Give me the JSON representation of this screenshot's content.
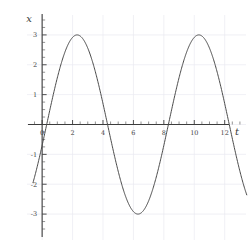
{
  "figure": {
    "background_color": "#ffffff",
    "curve_color": "#4a4a4a",
    "axis_color": "#3c3c3c",
    "grid_color": "#e9e9f0"
  },
  "axes": {
    "x_axis_label": "t",
    "y_axis_label": "x"
  },
  "chart_data": {
    "type": "line",
    "title": "",
    "subtitle": "",
    "xlabel": "t",
    "ylabel": "x",
    "xlim": [
      -0.6,
      13.4
    ],
    "ylim": [
      -3.6,
      3.6
    ],
    "grid": true,
    "legend": null,
    "legend_position": "none",
    "x_major_ticks": [
      0,
      2,
      4,
      6,
      8,
      10,
      12
    ],
    "x_major_tick_labels": [
      "0",
      "2",
      "4",
      "6",
      "8",
      "10",
      "12"
    ],
    "x_minor_tick_step": 0.5,
    "y_major_ticks": [
      -3,
      -2,
      -1,
      0,
      1,
      2,
      3
    ],
    "y_major_tick_labels": [
      "-3",
      "-2",
      "-1",
      "0",
      "1",
      "2",
      "3"
    ],
    "y_minor_tick_step": 0.25,
    "series": [
      {
        "name": "x(t)",
        "equation": "x = 3 sin(pi (t - 0.3) / 4)",
        "amplitude": 3,
        "period": 8,
        "phase_shift": 0.3,
        "x": [
          -0.6,
          -0.4,
          -0.2,
          0.0,
          0.3,
          0.6,
          1.0,
          1.4,
          1.8,
          2.3,
          2.8,
          3.2,
          3.6,
          4.0,
          4.3,
          4.7,
          5.1,
          5.5,
          6.0,
          6.3,
          6.8,
          7.2,
          7.6,
          8.0,
          8.3,
          8.7,
          9.1,
          9.5,
          10.0,
          10.3,
          10.8,
          11.2,
          11.6,
          12.0,
          12.3,
          12.7,
          13.1,
          13.4
        ],
        "y": [
          -2.06,
          -1.57,
          -1.04,
          -0.35,
          0.0,
          0.7,
          1.63,
          2.32,
          2.77,
          2.99,
          2.85,
          2.49,
          1.96,
          1.3,
          0.7,
          -0.12,
          -0.81,
          -1.63,
          -2.43,
          -2.77,
          -2.99,
          -2.96,
          -2.68,
          -2.18,
          -1.63,
          -0.93,
          -0.12,
          0.7,
          1.63,
          2.18,
          2.77,
          2.96,
          2.93,
          2.55,
          2.18,
          1.51,
          0.7,
          0.12
        ]
      }
    ],
    "annotations": [
      {
        "label": "first peak",
        "t": 2.3,
        "x": 3
      },
      {
        "label": "first trough",
        "t": 6.3,
        "x": -3
      },
      {
        "label": "second peak",
        "t": 10.3,
        "x": 3
      }
    ]
  }
}
